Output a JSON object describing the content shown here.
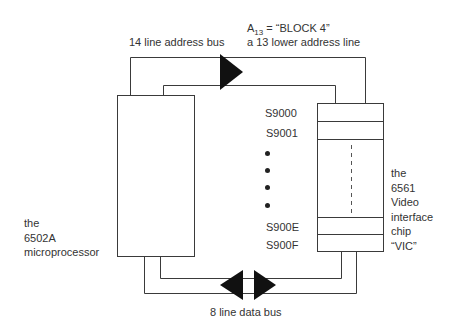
{
  "diagram": {
    "address_bus": {
      "label": "14 line address bus",
      "annotation_line1_prefix": "A",
      "annotation_line1_subscript": "13",
      "annotation_line1_suffix": " = “BLOCK 4”",
      "annotation_line2": "a 13 lower address line",
      "arrow_direction": "right"
    },
    "data_bus": {
      "label": "8 line data bus",
      "arrow_direction": "bidirectional"
    },
    "processor": {
      "label_lines": [
        "the",
        "6502A",
        "microprocessor"
      ]
    },
    "vic_chip": {
      "label_lines": [
        "the",
        "6561",
        "Video",
        "interface",
        "chip",
        "“VIC”"
      ]
    },
    "registers": {
      "top": [
        "S9000",
        "S9001"
      ],
      "ellipsis_dots": 4,
      "bottom": [
        "S900E",
        "S900F"
      ]
    },
    "colors": {
      "line": "#3a3a3a",
      "arrow_fill": "#111111",
      "background": "#ffffff"
    }
  }
}
